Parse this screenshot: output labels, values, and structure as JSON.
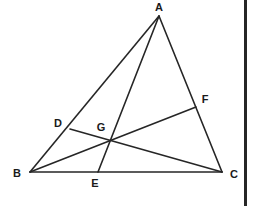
{
  "figure": {
    "kind": "euclidean-geometry-diagram",
    "width": 254,
    "height": 206,
    "background_color": "#ffffff",
    "stroke_color": "#262626",
    "label_color": "#1a1a1a",
    "stroke_width": 1.6,
    "right_border": {
      "color": "#262626",
      "x": 244,
      "width": 3
    },
    "points": [
      {
        "id": "A",
        "label": "A",
        "x": 159,
        "y": 16,
        "label_x": 159,
        "label_y": 7,
        "role": "triangle-apex"
      },
      {
        "id": "B",
        "label": "B",
        "x": 30,
        "y": 172,
        "label_x": 17,
        "label_y": 173,
        "role": "triangle-vertex"
      },
      {
        "id": "C",
        "label": "C",
        "x": 222,
        "y": 172,
        "label_x": 234,
        "label_y": 174,
        "role": "triangle-vertex"
      },
      {
        "id": "D",
        "label": "D",
        "x": 70,
        "y": 129,
        "label_x": 58,
        "label_y": 123,
        "role": "point-on-AB"
      },
      {
        "id": "E",
        "label": "E",
        "x": 98,
        "y": 172,
        "label_x": 95,
        "label_y": 183,
        "role": "point-on-BC"
      },
      {
        "id": "F",
        "label": "F",
        "x": 196,
        "y": 107,
        "label_x": 205,
        "label_y": 99,
        "role": "point-on-AC"
      },
      {
        "id": "G",
        "label": "G",
        "x": 107,
        "y": 140,
        "label_x": 101,
        "label_y": 127,
        "role": "cevian-intersection"
      }
    ],
    "segments": [
      {
        "id": "AB",
        "from": "A",
        "to": "B",
        "name": "side-ab"
      },
      {
        "id": "BC",
        "from": "B",
        "to": "C",
        "name": "side-bc"
      },
      {
        "id": "CA",
        "from": "C",
        "to": "A",
        "name": "side-ca"
      },
      {
        "id": "AE",
        "from": "A",
        "to": "E",
        "name": "cevian-ae"
      },
      {
        "id": "BF",
        "from": "B",
        "to": "F",
        "name": "cevian-bf"
      },
      {
        "id": "DC",
        "from": "D",
        "to": "C",
        "name": "cevian-dc"
      }
    ]
  }
}
